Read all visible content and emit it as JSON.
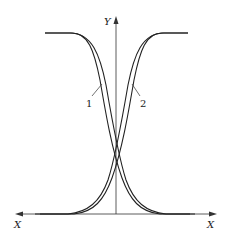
{
  "diagram": {
    "axes": {
      "y_label": "Y",
      "x_label_left": "X",
      "x_label_right": "X"
    },
    "curves": [
      {
        "id": "1",
        "label": "1"
      },
      {
        "id": "2",
        "label": "2"
      }
    ],
    "colors": {
      "line": "#222222",
      "background": "#ffffff"
    }
  }
}
